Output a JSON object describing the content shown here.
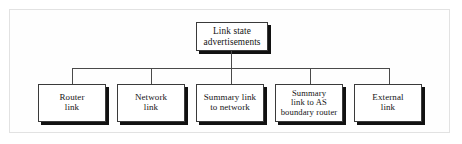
{
  "figure": {
    "title": "Link state advertisements",
    "frame_color": "#e2e2e2",
    "background": "#ffffff",
    "line_color": "#4a4a4a",
    "box_border_color": "#3a3a3a",
    "box_shadow_color": "#111111",
    "text_color": "#151515"
  },
  "root": {
    "label": "Link state\nadvertisements"
  },
  "leaves": [
    {
      "label": "Router\nlink"
    },
    {
      "label": "Network\nlink"
    },
    {
      "label": "Summary link\nto network"
    },
    {
      "label": "Summary\nlink to AS\nboundary router"
    },
    {
      "label": "External\nlink"
    }
  ]
}
